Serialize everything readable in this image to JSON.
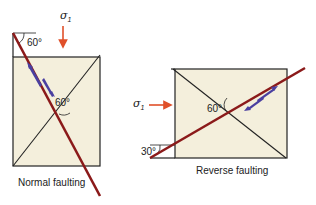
{
  "colors": {
    "fill": "#f4efdc",
    "outline": "#222222",
    "fault": "#8b1a1a",
    "stress_arrow": "#e0502a",
    "slip_arrow": "#4a3fa0"
  },
  "normal": {
    "caption": "Normal faulting",
    "stress_symbol": "σ",
    "stress_subscript": "1",
    "angle_top": "60°",
    "angle_center": "60°"
  },
  "reverse": {
    "caption": "Reverse faulting",
    "stress_symbol": "σ",
    "stress_subscript": "1",
    "angle_center": "60°",
    "angle_bottom": "30°"
  }
}
